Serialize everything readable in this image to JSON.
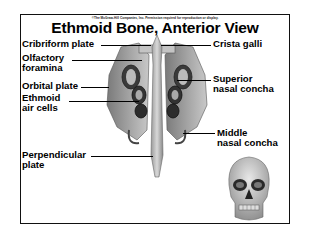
{
  "figure": {
    "copyright": "©The McGraw-Hill Companies, Inc. Permission required for reproduction or display.",
    "title": "Ethmoid Bone, Anterior View",
    "labels": {
      "cribriform_plate": "Cribriform plate",
      "olfactory_foramina_1": "Olfactory",
      "olfactory_foramina_2": "foramina",
      "orbital_plate": "Orbital plate",
      "ethmoid_air_cells_1": "Ethmoid",
      "ethmoid_air_cells_2": "air cells",
      "perpendicular_plate_1": "Perpendicular",
      "perpendicular_plate_2": "plate",
      "crista_galli": "Crista galli",
      "superior_nasal_concha_1": "Superior",
      "superior_nasal_concha_2": "nasal concha",
      "middle_nasal_concha_1": "Middle",
      "middle_nasal_concha_2": "nasal concha"
    },
    "illustrations": [
      "ethmoid-bone-anterior",
      "skull-anterior-locator"
    ]
  }
}
